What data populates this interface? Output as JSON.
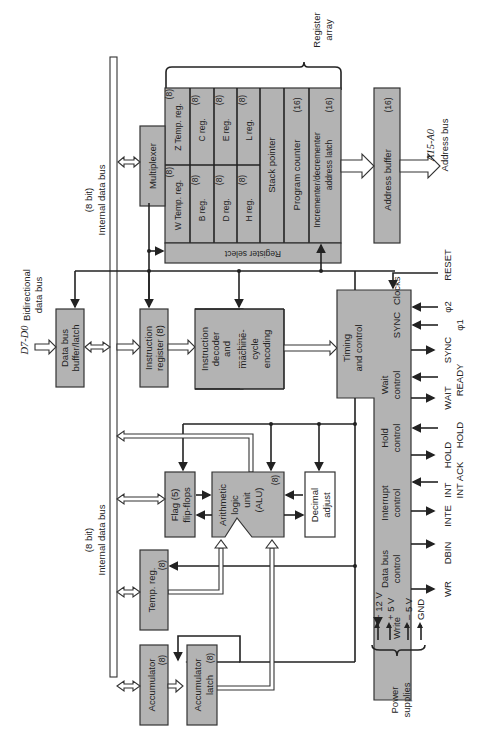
{
  "buses": {
    "internal_top": {
      "width": "(8 bit)",
      "label": "Internal data bus"
    },
    "internal_bottom": {
      "width": "(8 bit)",
      "label": "Internal data bus"
    },
    "bidirectional": {
      "line1": "Bidirectional",
      "line2": "data bus"
    },
    "data_pins": "D7-D0",
    "address_pins": "A15-A0",
    "address_label": "Address bus"
  },
  "register_array": {
    "label_line1": "Register",
    "label_line2": "array",
    "multiplexer": "Multiplexer",
    "register_select": "Register select",
    "registers": [
      {
        "name": "W Temp. reg.",
        "size": "(8)"
      },
      {
        "name": "Z Temp. reg.",
        "size": "(8)"
      },
      {
        "name": "B reg.",
        "size": "(8)"
      },
      {
        "name": "C reg.",
        "size": "(8)"
      },
      {
        "name": "D reg.",
        "size": "(8)"
      },
      {
        "name": "E reg.",
        "size": "(8)"
      },
      {
        "name": "H reg.",
        "size": "(8)"
      },
      {
        "name": "L reg.",
        "size": "(8)"
      }
    ],
    "stack_pointer": "Stack pointer",
    "program_counter": {
      "name": "Program counter",
      "size": "(16)"
    },
    "inc_dec": {
      "line1": "Incrementer/decrementer",
      "line2": "address latch",
      "size": "(16)"
    }
  },
  "address_buffer": {
    "name": "Address buffer",
    "size": "(16)"
  },
  "data_bus_buffer": {
    "line1": "Data bus",
    "line2": "buffer/latch"
  },
  "instruction_register": {
    "line1": "Instruction",
    "line2": "register  (8)"
  },
  "instruction_decoder": {
    "line1": "Instruction",
    "line2": "decoder",
    "line3": "and",
    "line4": "machine-",
    "line5": "cycle",
    "line6": "encoding"
  },
  "timing_control": {
    "line1": "Timing",
    "line2": "and control",
    "sections": [
      {
        "line1": "SYNC",
        "line2": "Clocks"
      },
      {
        "line1": "Wait",
        "line2": "control"
      },
      {
        "line1": "Hold",
        "line2": "control"
      },
      {
        "line1": "Interrupt",
        "line2": "control"
      },
      {
        "line1": "Data bus",
        "line2": "control"
      },
      {
        "line1": "Write",
        "line2": ""
      }
    ],
    "signals": [
      "RESET",
      "φ2",
      "φ1",
      "SYNC",
      "READY",
      "WAIT",
      "HOLD",
      "HOLD",
      "INT ACK",
      "INT",
      "INTE",
      "DBIN",
      "WR"
    ]
  },
  "alu_section": {
    "flags": {
      "line1": "Flag  (5)",
      "line2": "flip-flops"
    },
    "alu": {
      "line1": "Arithmetic",
      "line2": "logic",
      "line3": "unit",
      "line4": "(ALU)",
      "size": "(8)"
    },
    "decimal_adjust": {
      "line1": "Decimal",
      "line2": "adjust"
    },
    "temp_reg": {
      "line1": "Temp. reg.",
      "size": "(8)"
    },
    "accumulator": {
      "line1": "Accumulator",
      "size": "(8)"
    },
    "accumulator_latch": {
      "line1": "Accumulator",
      "line2": "latch",
      "size": "(8)"
    }
  },
  "power": {
    "label_line1": "Power",
    "label_line2": "supplies",
    "rails": [
      "+ 12 V",
      "+ 5 V",
      "– 5 V",
      "GND"
    ]
  }
}
